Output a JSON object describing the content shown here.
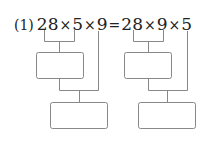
{
  "problem": {
    "label": "(1)",
    "left_expression": [
      "28",
      "×",
      "5",
      "×",
      "9"
    ],
    "equals": "=",
    "right_expression": [
      "28",
      "×",
      "9",
      "×",
      "5"
    ]
  },
  "diagram": {
    "left_tree": {
      "first_pair": [
        "28",
        "5"
      ],
      "then": "9",
      "boxes": [
        "",
        ""
      ]
    },
    "right_tree": {
      "first_pair": [
        "28",
        "9"
      ],
      "then": "5",
      "boxes": [
        "",
        ""
      ]
    },
    "line_color": "#888888",
    "box_border_color": "#888888"
  }
}
